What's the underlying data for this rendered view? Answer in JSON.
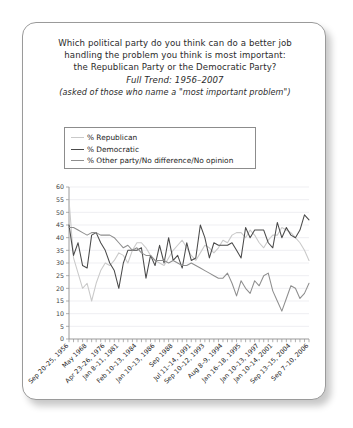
{
  "card": {
    "title_lines": [
      {
        "text": "Which political party do you think can do a better job",
        "style": "normal"
      },
      {
        "text": "handling the problem you think is most important:",
        "style": "normal"
      },
      {
        "text": "the Republican Party or the Democratic Party?",
        "style": "normal"
      },
      {
        "text": "Full Trend: 1956–2007",
        "style": "italic"
      },
      {
        "text": "(asked of those who name a \"most important problem\")",
        "style": "small-italic"
      }
    ]
  },
  "legend": {
    "position": "upper-left",
    "items": [
      {
        "label": "% Republican",
        "color": "#c9c9c9"
      },
      {
        "label": "% Democratic",
        "color": "#4a4a4a"
      },
      {
        "label": "% Other party/No difference/No opinion",
        "color": "#8e8e8e"
      }
    ]
  },
  "chart_data": {
    "type": "line",
    "title": "Which political party do you think can do a better job handling the problem you think is most important: the Republican Party or the Democratic Party?",
    "subtitle": "Full Trend: 1956–2007",
    "note": "(asked of those who name a \"most important problem\")",
    "xlabel": "",
    "ylabel": "",
    "ylim": [
      0,
      60
    ],
    "yticks": [
      0,
      5,
      10,
      15,
      20,
      25,
      30,
      35,
      40,
      45,
      50,
      55,
      60
    ],
    "grid": true,
    "legend_position": "upper-left",
    "x_tick_labels": [
      "Sep 20–25, 1956",
      "May 1968",
      "Apr 23–26, 1976",
      "Jan 8–11, 1981",
      "Feb 10–13, 1984",
      "Jan 10–13, 1986",
      "Sep 1988",
      "Jul 11–14, 1991",
      "Sep 10–12, 1993",
      "Aug 8–9, 1994",
      "Jan 16–18, 1995",
      "Jan 10–13, 1997",
      "Jan 10–14, 2001",
      "Sep 13–15, 2004",
      "Sep 7–10, 2006"
    ],
    "series": [
      {
        "name": "% Republican",
        "color": "#c9c9c9",
        "values": [
          55,
          32,
          26,
          20,
          22,
          15,
          22,
          27,
          30,
          29,
          31,
          34,
          33,
          30,
          35,
          38,
          38,
          36,
          33,
          31,
          30,
          29,
          32,
          35,
          37,
          39,
          36,
          33,
          31,
          34,
          37,
          36,
          34,
          36,
          39,
          38,
          41,
          42,
          42,
          40,
          43,
          41,
          38,
          36,
          39,
          41,
          41,
          44,
          43,
          42,
          40,
          38,
          35,
          31
        ]
      },
      {
        "name": "% Democratic",
        "color": "#4a4a4a",
        "values": [
          45,
          33,
          38,
          29,
          28,
          41,
          42,
          38,
          35,
          30,
          27,
          20,
          30,
          35,
          35,
          35,
          36,
          24,
          33,
          29,
          37,
          30,
          40,
          31,
          33,
          28,
          38,
          31,
          32,
          45,
          40,
          32,
          38,
          37,
          37,
          37,
          38,
          35,
          32,
          44,
          40,
          43,
          43,
          43,
          38,
          36,
          46,
          40,
          44,
          41,
          40,
          43,
          49,
          47
        ]
      },
      {
        "name": "% Other party/No difference/No opinion",
        "color": "#8e8e8e",
        "values": [
          44,
          44,
          43,
          42,
          41,
          42,
          42,
          41,
          41,
          41,
          40,
          38,
          36,
          37,
          35,
          36,
          34,
          33,
          33,
          31,
          31,
          31,
          30,
          31,
          30,
          29,
          29,
          30,
          29,
          28,
          27,
          26,
          25,
          24,
          24,
          26,
          22,
          17,
          23,
          20,
          18,
          23,
          21,
          25,
          26,
          19,
          15,
          11,
          16,
          21,
          20,
          16,
          18,
          22
        ]
      }
    ]
  }
}
